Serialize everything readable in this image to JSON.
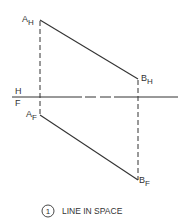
{
  "diagram": {
    "title": "LINE IN SPACE",
    "figure_number": "1",
    "reference_line": {
      "upper_label": "H",
      "lower_label": "F"
    },
    "points": {
      "a_h": {
        "base": "A",
        "sub": "H"
      },
      "b_h": {
        "base": "B",
        "sub": "H"
      },
      "a_f": {
        "base": "A",
        "sub": "F"
      },
      "b_f": {
        "base": "B",
        "sub": "F"
      }
    },
    "colors": {
      "line": "#333333",
      "background": "#ffffff"
    }
  }
}
